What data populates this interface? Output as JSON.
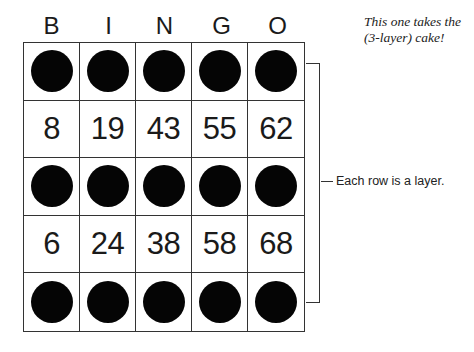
{
  "headers": [
    "B",
    "I",
    "N",
    "G",
    "O"
  ],
  "rows": [
    {
      "type": "marked",
      "cells": [
        "",
        "",
        "",
        "",
        ""
      ]
    },
    {
      "type": "numbers",
      "cells": [
        "8",
        "19",
        "43",
        "55",
        "62"
      ]
    },
    {
      "type": "marked",
      "cells": [
        "",
        "",
        "",
        "",
        ""
      ]
    },
    {
      "type": "numbers",
      "cells": [
        "6",
        "24",
        "38",
        "58",
        "68"
      ]
    },
    {
      "type": "marked",
      "cells": [
        "",
        "",
        "",
        "",
        ""
      ]
    }
  ],
  "annotation": {
    "bracket_label": "Each row is a layer."
  },
  "note": {
    "line1": "This one takes the",
    "line2": "(3-layer) cake!"
  },
  "colors": {
    "dot": "#050505",
    "grid_line": "#333333",
    "background": "#ffffff"
  }
}
